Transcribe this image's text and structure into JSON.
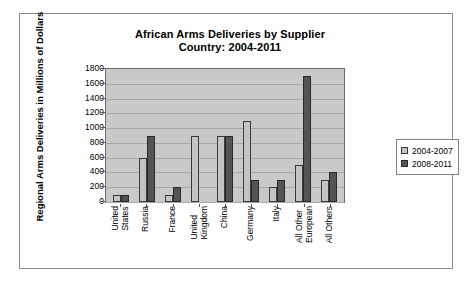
{
  "chart_data": {
    "type": "bar",
    "title": "African Arms Deliveries by Supplier Country: 2004-2011",
    "title_line1": "African Arms Deliveries by Supplier",
    "title_line2": "Country: 2004-2011",
    "xlabel": "",
    "ylabel": "Regional Arms Deliveries in Millions of Dollars",
    "ylim": [
      0,
      1800
    ],
    "ytick_step": 200,
    "yticks": [
      1800,
      1600,
      1400,
      1200,
      1000,
      800,
      600,
      400,
      200,
      0
    ],
    "grid": true,
    "legend_position": "right",
    "categories": [
      "United States",
      "Russia",
      "France",
      "United Kingdom",
      "China",
      "Germany",
      "Italy",
      "All Other European",
      "All Others"
    ],
    "category_lines": [
      [
        "United",
        "States"
      ],
      [
        "Russia",
        ""
      ],
      [
        "France",
        ""
      ],
      [
        "United",
        "Kingdom"
      ],
      [
        "China",
        ""
      ],
      [
        "Germany",
        ""
      ],
      [
        "Italy",
        ""
      ],
      [
        "All Other",
        "European"
      ],
      [
        "All Others",
        ""
      ]
    ],
    "series": [
      {
        "name": "2004-2007",
        "color": "#c4c4c4",
        "values": [
          100,
          600,
          100,
          900,
          900,
          1100,
          200,
          500,
          300
        ]
      },
      {
        "name": "2008-2011",
        "color": "#545454",
        "values": [
          100,
          900,
          200,
          0,
          900,
          300,
          300,
          1700,
          400
        ]
      }
    ]
  },
  "colors": {
    "plot_background": "#c9c9c9",
    "gridline": "#a8a8a8",
    "axis": "#555555",
    "frame_border": "#8a8a8a",
    "page_background": "#ffffff"
  }
}
